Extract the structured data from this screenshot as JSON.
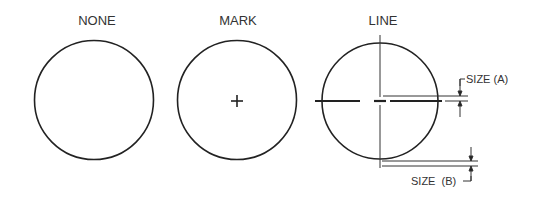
{
  "diagram": {
    "panels": [
      {
        "label": "NONE",
        "center_style": "none"
      },
      {
        "label": "MARK",
        "center_style": "mark"
      },
      {
        "label": "LINE",
        "center_style": "line"
      }
    ],
    "dimensions": {
      "size_a": "SIZE (A)",
      "size_b": "SIZE  (B)"
    },
    "colors": {
      "stroke": "#222222",
      "text": "#333333",
      "background": "#ffffff"
    }
  }
}
